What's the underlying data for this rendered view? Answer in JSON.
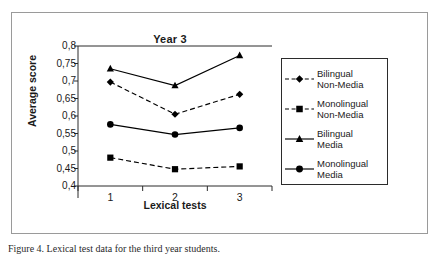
{
  "figure": {
    "caption": "Figure 4. Lexical test data for the third year students."
  },
  "chart_data": {
    "type": "line",
    "title": "Year 3",
    "xlabel": "Lexical tests",
    "ylabel": "Average score",
    "x": [
      1,
      2,
      3
    ],
    "categories": [
      "1",
      "2",
      "3"
    ],
    "xtick_labels": [
      "1",
      "2",
      "3"
    ],
    "ytick_labels": [
      "0,8",
      "0,75",
      "0,7",
      "0,65",
      "0,6",
      "0,55",
      "0,5",
      "0,45",
      "0,4"
    ],
    "ytick_values": [
      0.8,
      0.75,
      0.7,
      0.65,
      0.6,
      0.55,
      0.5,
      0.45,
      0.4
    ],
    "ylim": [
      0.4,
      0.8
    ],
    "xlim": [
      0.5,
      3.5
    ],
    "grid": false,
    "legend_position": "right",
    "decimal_separator": ",",
    "series": [
      {
        "name": "Bilingual Non-Media",
        "label_line1": "Bilingual",
        "label_line2": "Non-Media",
        "values": [
          0.697,
          0.605,
          0.662
        ],
        "line_style": "dashed",
        "marker": "diamond",
        "color": "#000000"
      },
      {
        "name": "Monolingual Non-Media",
        "label_line1": "Monolingual",
        "label_line2": "Non-Media",
        "values": [
          0.481,
          0.448,
          0.456
        ],
        "line_style": "dashed",
        "marker": "square",
        "color": "#000000"
      },
      {
        "name": "Bilingual Media",
        "label_line1": "Bilingual",
        "label_line2": "Media",
        "values": [
          0.735,
          0.687,
          0.773
        ],
        "line_style": "solid",
        "marker": "triangle",
        "color": "#000000"
      },
      {
        "name": "Monolingual Media",
        "label_line1": "Monolingual",
        "label_line2": "Media",
        "values": [
          0.576,
          0.547,
          0.566
        ],
        "line_style": "solid",
        "marker": "circle",
        "color": "#000000"
      }
    ]
  },
  "colors": {
    "axis": "#2b2b2b",
    "frame": "#9a9a9a",
    "series": "#000000",
    "background": "#ffffff"
  }
}
